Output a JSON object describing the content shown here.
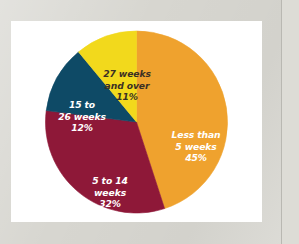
{
  "page": {
    "background_color": "#d7d6d0",
    "card_background_color": "#ffffff"
  },
  "chart_data": {
    "type": "pie",
    "title": "",
    "subtitle": "",
    "xlabel": "",
    "ylabel": "",
    "legend_position": "none",
    "grid": false,
    "start_angle_deg": 0,
    "direction": "clockwise",
    "units": "percent",
    "categories": [
      "Less than 5 weeks",
      "5 to 14 weeks",
      "15 to 26 weeks",
      "27 weeks and over"
    ],
    "values": [
      45,
      32,
      12,
      11
    ],
    "colors": [
      "#efa22e",
      "#8e1838",
      "#0e4a66",
      "#f2d91c"
    ],
    "slices": [
      {
        "id": "orange",
        "label": "Less than\n5 weeks",
        "label_line1": "Less than",
        "label_line2": "5 weeks",
        "value": 45,
        "value_text": "45%",
        "color": "#efa22e",
        "label_color": "#ffffff",
        "start_deg": 0,
        "end_deg": 162
      },
      {
        "id": "red",
        "label": "5 to 14\nweeks",
        "label_line1": "5 to 14",
        "label_line2": "weeks",
        "value": 32,
        "value_text": "32%",
        "color": "#8e1838",
        "label_color": "#ffffff",
        "start_deg": 162,
        "end_deg": 277.2
      },
      {
        "id": "blue",
        "label": "15 to\n26 weeks",
        "label_line1": "15 to",
        "label_line2": "26 weeks",
        "value": 12,
        "value_text": "12%",
        "color": "#0e4a66",
        "label_color": "#ffffff",
        "start_deg": 277.2,
        "end_deg": 320.4
      },
      {
        "id": "yellow",
        "label": "27 weeks\nand over",
        "label_line1": "27 weeks",
        "label_line2": "and over",
        "value": 11,
        "value_text": "11%",
        "color": "#f2d91c",
        "label_color": "#3b3024",
        "start_deg": 320.4,
        "end_deg": 360
      }
    ]
  }
}
